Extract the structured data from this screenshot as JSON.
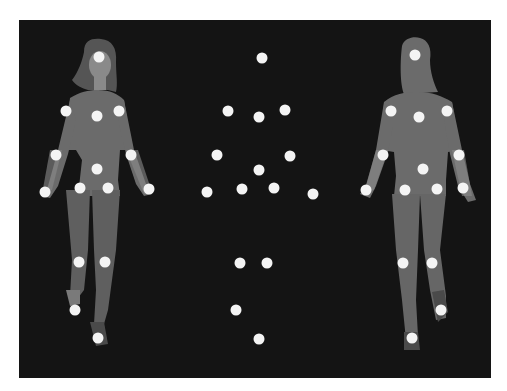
{
  "scene": {
    "description": "Point-light display: front-facing woman, isolated point-light walker, back-facing woman",
    "colors": {
      "background": "#141414",
      "page": "#ffffff",
      "silhouette": "#6b6b6b",
      "silhouette_dark": "#5a5a5a",
      "skin": "#8a8a8a",
      "hair": "#555555",
      "marker": "#f4f4f4"
    },
    "marker_radius": 5.5
  },
  "figures": [
    {
      "name": "front-figure",
      "markers": [
        [
          99,
          57
        ],
        [
          66,
          111
        ],
        [
          97,
          116
        ],
        [
          119,
          111
        ],
        [
          56,
          155
        ],
        [
          131,
          155
        ],
        [
          97,
          169
        ],
        [
          45,
          192
        ],
        [
          149,
          189
        ],
        [
          80,
          188
        ],
        [
          108,
          188
        ],
        [
          79,
          262
        ],
        [
          105,
          262
        ],
        [
          75,
          310
        ],
        [
          98,
          338
        ]
      ]
    },
    {
      "name": "point-light-figure",
      "markers": [
        [
          262,
          58
        ],
        [
          228,
          111
        ],
        [
          259,
          117
        ],
        [
          285,
          110
        ],
        [
          217,
          155
        ],
        [
          290,
          156
        ],
        [
          259,
          170
        ],
        [
          207,
          192
        ],
        [
          313,
          194
        ],
        [
          242,
          189
        ],
        [
          274,
          188
        ],
        [
          240,
          263
        ],
        [
          267,
          263
        ],
        [
          236,
          310
        ],
        [
          259,
          339
        ]
      ]
    },
    {
      "name": "back-figure",
      "markers": [
        [
          415,
          55
        ],
        [
          391,
          111
        ],
        [
          419,
          117
        ],
        [
          447,
          111
        ],
        [
          383,
          155
        ],
        [
          459,
          155
        ],
        [
          423,
          169
        ],
        [
          366,
          190
        ],
        [
          463,
          188
        ],
        [
          405,
          190
        ],
        [
          437,
          189
        ],
        [
          403,
          263
        ],
        [
          432,
          263
        ],
        [
          441,
          310
        ],
        [
          412,
          338
        ]
      ]
    }
  ]
}
